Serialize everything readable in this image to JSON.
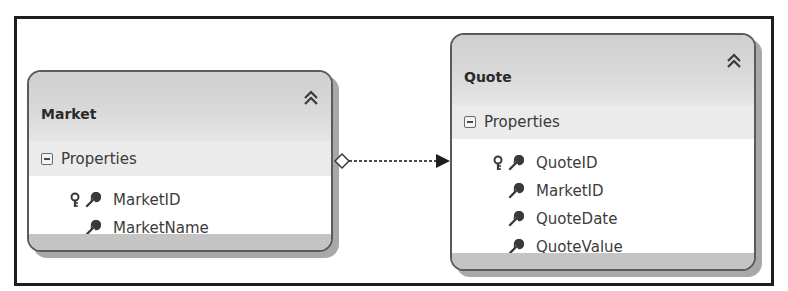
{
  "diagram": {
    "type": "entity-data-model",
    "entities": [
      {
        "name": "Market",
        "section_label": "Properties",
        "properties": [
          {
            "name": "MarketID",
            "is_key": true
          },
          {
            "name": "MarketName",
            "is_key": false
          }
        ]
      },
      {
        "name": "Quote",
        "section_label": "Properties",
        "properties": [
          {
            "name": "QuoteID",
            "is_key": true
          },
          {
            "name": "MarketID",
            "is_key": false
          },
          {
            "name": "QuoteDate",
            "is_key": false
          },
          {
            "name": "QuoteValue",
            "is_key": false
          }
        ]
      }
    ],
    "associations": [
      {
        "from": "Market",
        "to": "Quote",
        "from_end": "diamond",
        "to_end": "arrow",
        "style": "dashed"
      }
    ],
    "icons": {
      "collapse": "double-chevron-up-icon",
      "section_toggle": "minus-box-icon",
      "key": "key-icon",
      "property": "wrench-icon"
    },
    "colors": {
      "frame_border": "#1e1e1e",
      "entity_border": "#5a5a5a",
      "header_fill": "#d6d6d6",
      "properties_band": "#ebebeb",
      "shadow": "#a8a8a8",
      "text": "#3c3c3c"
    }
  }
}
